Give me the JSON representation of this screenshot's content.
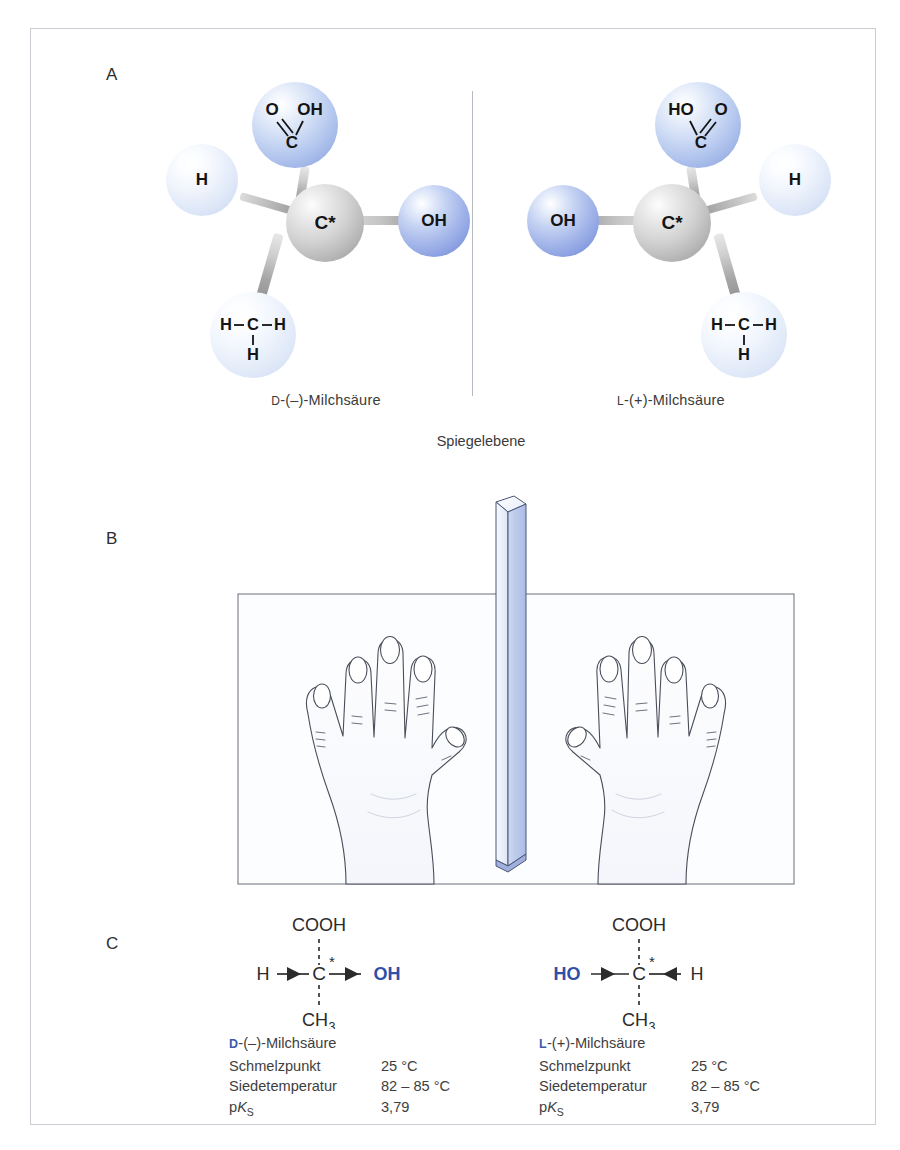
{
  "figure": {
    "panels": [
      "A",
      "B",
      "C"
    ],
    "mirror_plane_label": "Spiegelebene"
  },
  "panel_a": {
    "letter": "A",
    "left_molecule": {
      "name": "D-(–)-Milchsäure",
      "name_prefix": "D",
      "name_rest": "-(–)-Milchsäure",
      "center_atom": "C*",
      "substituents": [
        {
          "position": "top",
          "label": "COOH",
          "parts": {
            "o": "O",
            "oh": "OH",
            "c": "C"
          },
          "color_role": "carboxyl"
        },
        {
          "position": "left",
          "label": "H",
          "color_role": "hydrogen"
        },
        {
          "position": "right",
          "label": "OH",
          "color_role": "hydroxyl"
        },
        {
          "position": "bottom",
          "label": "CH3",
          "parts": {
            "left_h": "H",
            "c": "C",
            "right_h": "H",
            "bottom_h": "H"
          },
          "color_role": "methyl"
        }
      ]
    },
    "right_molecule": {
      "name": "L-(+)-Milchsäure",
      "name_prefix": "L",
      "name_rest": "-(+)-Milchsäure",
      "center_atom": "C*",
      "substituents": [
        {
          "position": "top",
          "label": "COOH",
          "parts": {
            "oh": "HO",
            "o": "O",
            "c": "C"
          },
          "color_role": "carboxyl"
        },
        {
          "position": "left",
          "label": "OH",
          "color_role": "hydroxyl"
        },
        {
          "position": "right",
          "label": "H",
          "color_role": "hydrogen"
        },
        {
          "position": "bottom",
          "label": "CH3",
          "parts": {
            "left_h": "H",
            "c": "C",
            "right_h": "H",
            "bottom_h": "H"
          },
          "color_role": "methyl"
        }
      ]
    }
  },
  "panel_b": {
    "letter": "B",
    "description": "Linke und rechte Hand als Spiegelbilder an einem Spiegel",
    "objects": [
      "left-hand",
      "mirror-glass-pane",
      "right-hand"
    ]
  },
  "panel_c": {
    "letter": "C",
    "left": {
      "structure": {
        "top": "COOH",
        "left": "H",
        "center": "C",
        "center_star": "*",
        "right": "OH",
        "bottom": "CH",
        "bottom_sub": "3"
      },
      "name_prefix": "D",
      "name_rest": "-(–)-Milchsäure",
      "properties": [
        {
          "key": "Schmelzpunkt",
          "value": "25 °C"
        },
        {
          "key": "Siedetemperatur",
          "value": "82 – 85 °C"
        },
        {
          "key": "pKS",
          "value": "3,79"
        }
      ]
    },
    "right": {
      "structure": {
        "top": "COOH",
        "left": "HO",
        "center": "C",
        "center_star": "*",
        "right": "H",
        "bottom": "CH",
        "bottom_sub": "3"
      },
      "name_prefix": "L",
      "name_rest": "-(+)-Milchsäure",
      "properties": [
        {
          "key": "Schmelzpunkt",
          "value": "25 °C"
        },
        {
          "key": "Siedetemperatur",
          "value": "82 – 85 °C"
        },
        {
          "key": "pKS",
          "value": "3,79"
        }
      ]
    },
    "pk_label": {
      "p": "p",
      "k": "K",
      "s": "S"
    }
  },
  "colors": {
    "frame_border": "#c9ccd2",
    "carboxyl_sphere": "#b3c6ee",
    "hydroxyl_sphere": "#9fb2e8",
    "hydrogen_sphere": "#dce6f7",
    "methyl_sphere": "#e0e9f8",
    "center_sphere": "#d2d2d2",
    "mirror_glass": "#b8c6ea",
    "accent_blue_text": "#3a5bab",
    "text": "#3e3e3e"
  }
}
